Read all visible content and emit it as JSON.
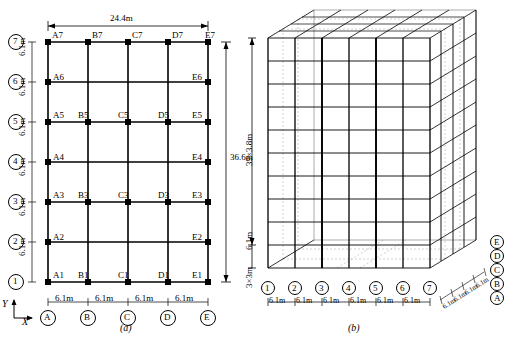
{
  "figure": {
    "caption_a": "(a)",
    "caption_b": "(b)",
    "axis_x": "X",
    "axis_y": "Y"
  },
  "plan": {
    "top_dim": "24.4m",
    "right_dim": "36.6m",
    "bay_width": "6.1m",
    "story_height": "6.1m",
    "column_lines": [
      "A",
      "B",
      "C",
      "D",
      "E"
    ],
    "floor_lines": [
      "1",
      "2",
      "3",
      "4",
      "5",
      "6",
      "7"
    ],
    "bottom_dims": [
      "6.1m",
      "6.1m",
      "6.1m",
      "6.1m"
    ],
    "left_dims": [
      "6.1m",
      "6.1m",
      "6.1m",
      "6.1m",
      "6.1m",
      "6.1m"
    ],
    "node_labels_row7": [
      "A7",
      "B7",
      "C7",
      "D7",
      "E7"
    ],
    "node_labels_row6": [
      "A6",
      "E6"
    ],
    "node_labels_row5": [
      "A5",
      "B5",
      "C5",
      "D5",
      "E5"
    ],
    "node_labels_row4": [
      "A4",
      "E4"
    ],
    "node_labels_row3": [
      "A3",
      "B3",
      "C3",
      "D3",
      "E3"
    ],
    "node_labels_row2": [
      "A2",
      "E2"
    ],
    "node_labels_row1": [
      "A1",
      "B1",
      "C1",
      "D1",
      "E1"
    ]
  },
  "iso": {
    "height_dim": "39×3.8m",
    "mid_dim": "6.1m",
    "base_dim": "3×3m",
    "bottom_labels": [
      "1",
      "2",
      "3",
      "4",
      "5",
      "6",
      "7"
    ],
    "bottom_dims": [
      "6.1m",
      "6.1m",
      "6.1m",
      "6.1m",
      "6.1m",
      "6.1m"
    ],
    "depth_labels": [
      "A",
      "B",
      "C",
      "D",
      "E"
    ],
    "depth_dims": [
      "6.1m",
      "6.1m",
      "6.1m",
      "6.1m"
    ]
  }
}
